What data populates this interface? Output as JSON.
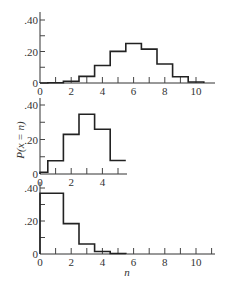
{
  "chart_data": [
    {
      "type": "bar",
      "style": "step-histogram",
      "panel": "top",
      "x": [
        0,
        1,
        2,
        3,
        4,
        5,
        6,
        7,
        8,
        9,
        10
      ],
      "values": [
        0.0001,
        0.002,
        0.011,
        0.042,
        0.111,
        0.201,
        0.251,
        0.215,
        0.121,
        0.04,
        0.006
      ],
      "xlim": [
        0,
        11
      ],
      "ylim": [
        0,
        0.45
      ],
      "xticks": [
        "0",
        "2",
        "4",
        "6",
        "8",
        "10"
      ],
      "yticks": [
        ".40",
        ".20",
        "0"
      ],
      "grid": false
    },
    {
      "type": "bar",
      "style": "step-histogram",
      "panel": "middle",
      "x": [
        0,
        1,
        2,
        3,
        4,
        5
      ],
      "values": [
        0.01,
        0.077,
        0.23,
        0.346,
        0.259,
        0.078
      ],
      "xlim": [
        0,
        5.5
      ],
      "ylim": [
        0,
        0.45
      ],
      "xticks": [
        "0",
        "2",
        "4"
      ],
      "yticks": [
        ".40",
        ".20",
        "0"
      ],
      "ylabel": "P(x = n)",
      "grid": false
    },
    {
      "type": "bar",
      "style": "step-histogram",
      "panel": "bottom",
      "x": [
        0,
        1,
        2,
        3,
        4,
        5
      ],
      "values": [
        0.368,
        0.368,
        0.184,
        0.061,
        0.015,
        0.003
      ],
      "xlim": [
        0,
        11
      ],
      "ylim": [
        0,
        0.45
      ],
      "xticks": [
        "0",
        "2",
        "4",
        "6",
        "8",
        "10"
      ],
      "yticks": [
        ".40",
        ".20",
        "0"
      ],
      "xlabel": "n",
      "grid": false
    }
  ],
  "labels": {
    "ylabel": "P(x = n)",
    "xlabel": "n",
    "y40": ".40",
    "y20": ".20",
    "y0": "0",
    "x0": "0",
    "x2": "2",
    "x4": "4",
    "x6": "6",
    "x8": "8",
    "x10": "10"
  }
}
